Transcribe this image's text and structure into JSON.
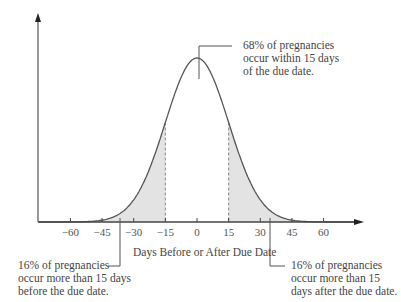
{
  "chart_data": {
    "type": "area",
    "title": "",
    "xlabel": "Days Before or After Due Date",
    "ylabel": "",
    "distribution": "normal",
    "mean": 0,
    "std_dev": 15,
    "xlim": [
      -75,
      75
    ],
    "x_ticks": [
      -60,
      -45,
      -30,
      -15,
      0,
      15,
      30,
      45,
      60
    ],
    "x_tick_labels": [
      "−60",
      "−45",
      "−30",
      "−15",
      "0",
      "15",
      "30",
      "45",
      "60"
    ],
    "shaded_regions": [
      {
        "from": -75,
        "to": -15,
        "percent": 16
      },
      {
        "from": 15,
        "to": 75,
        "percent": 16
      }
    ],
    "dashed_lines_at": [
      -15,
      15
    ],
    "grid": false,
    "annotations": [
      {
        "id": "center",
        "text": [
          "68% of pregnancies",
          "occur within 15 days",
          "of the due date."
        ],
        "percent": 68
      },
      {
        "id": "left",
        "text": [
          "16% of pregnancies",
          "occur more than 15 days",
          "before the due date."
        ],
        "percent": 16
      },
      {
        "id": "right",
        "text": [
          "16% of pregnancies",
          "occur more than 15",
          "days after the due date."
        ],
        "percent": 16
      }
    ]
  },
  "colors": {
    "curve": "#555555",
    "axis": "#444444",
    "shade": "#e3e3e3",
    "dash": "#888888",
    "text": "#444444"
  }
}
